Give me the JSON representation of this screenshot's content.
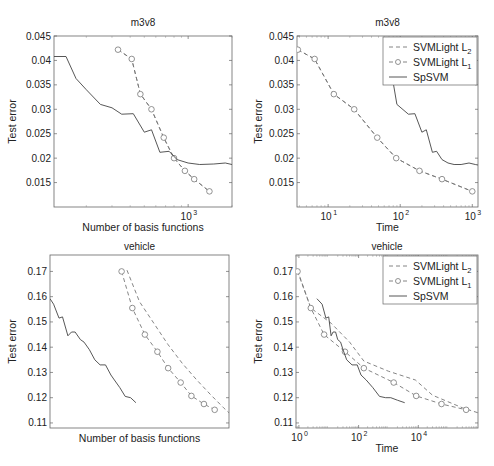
{
  "chart_data": [
    {
      "id": "m3v8-basis",
      "type": "line",
      "title": "m3v8",
      "xlabel": "Number of basis functions",
      "ylabel": "Test error",
      "xscale": "log",
      "xlim": [
        120,
        2000
      ],
      "ylim": [
        0.01,
        0.045
      ],
      "yticks": [
        "0.045",
        "0.04",
        "0.035",
        "0.03",
        "0.025",
        "0.02",
        "0.015"
      ],
      "xticks": [
        {
          "value": 1000,
          "label": "10",
          "exp": "3"
        }
      ],
      "grid": false,
      "legend": null,
      "series": [
        {
          "name": "SVMLight L2",
          "style": "dashed",
          "x": [
            330,
            410,
            470,
            560,
            680,
            800,
            950,
            1100,
            1400
          ],
          "y": [
            0.0422,
            0.0403,
            0.0331,
            0.03,
            0.0242,
            0.02,
            0.0174,
            0.0157,
            0.0132
          ]
        },
        {
          "name": "SVMLight L1",
          "style": "dashed-circle",
          "x": [
            330,
            410,
            470,
            560,
            680,
            800,
            950,
            1100,
            1400
          ],
          "y": [
            0.0422,
            0.0403,
            0.0331,
            0.03,
            0.0242,
            0.02,
            0.0174,
            0.0157,
            0.0132
          ]
        },
        {
          "name": "SpSVM",
          "style": "solid",
          "x": [
            120,
            145,
            170,
            200,
            250,
            300,
            350,
            420,
            500,
            560,
            640,
            740,
            840,
            1000,
            1200,
            1500,
            1800,
            2000
          ],
          "y": [
            0.0408,
            0.0408,
            0.0363,
            0.034,
            0.031,
            0.0303,
            0.029,
            0.0291,
            0.0253,
            0.0258,
            0.0212,
            0.0214,
            0.0197,
            0.019,
            0.0187,
            0.0188,
            0.019,
            0.0187
          ]
        }
      ]
    },
    {
      "id": "m3v8-time",
      "type": "line",
      "title": "m3v8",
      "xlabel": "Time",
      "ylabel": "Test error",
      "xscale": "log",
      "xlim": [
        3.7,
        1200
      ],
      "ylim": [
        0.01,
        0.045
      ],
      "yticks": [
        "0.045",
        "0.04",
        "0.035",
        "0.03",
        "0.025",
        "0.02",
        "0.015"
      ],
      "xticks": [
        {
          "value": 10,
          "label": "10",
          "exp": "1"
        },
        {
          "value": 100,
          "label": "10",
          "exp": "2"
        },
        {
          "value": 1000,
          "label": "10",
          "exp": "3"
        }
      ],
      "grid": false,
      "legend": {
        "position": "upper right",
        "entries": [
          {
            "label": "SVMLight L",
            "sub": "2",
            "style": "dashed"
          },
          {
            "label": "SVMLight L",
            "sub": "1",
            "style": "dashed-circle"
          },
          {
            "label": "SpSVM",
            "style": "solid"
          }
        ]
      },
      "series": [
        {
          "name": "SVMLight L2",
          "style": "dashed",
          "x": [
            3.8,
            6.5,
            12,
            23,
            48,
            88,
            185,
            380,
            1000
          ],
          "y": [
            0.0422,
            0.0403,
            0.0331,
            0.03,
            0.0242,
            0.02,
            0.0174,
            0.0157,
            0.0132
          ]
        },
        {
          "name": "SVMLight L1",
          "style": "dashed-circle",
          "x": [
            3.8,
            6.5,
            12,
            23,
            48,
            88,
            185,
            380,
            1000
          ],
          "y": [
            0.0422,
            0.0403,
            0.0331,
            0.03,
            0.0242,
            0.02,
            0.0174,
            0.0157,
            0.0132
          ]
        },
        {
          "name": "SpSVM",
          "style": "solid",
          "x": [
            65,
            70,
            90,
            130,
            160,
            200,
            230,
            280,
            320,
            380,
            460,
            560,
            700,
            900,
            1100,
            1200
          ],
          "y": [
            0.0408,
            0.0405,
            0.031,
            0.029,
            0.0291,
            0.0253,
            0.0258,
            0.0212,
            0.0214,
            0.0197,
            0.019,
            0.0187,
            0.0187,
            0.019,
            0.0187,
            0.0186
          ]
        }
      ]
    },
    {
      "id": "vehicle-basis",
      "type": "line",
      "title": "vehicle",
      "xlabel": "Number of basis functions",
      "ylabel": "Test error",
      "xscale": "linear",
      "xlim": [
        0,
        1
      ],
      "ylim": [
        0.108,
        0.1765
      ],
      "yticks": [
        "0.17",
        "0.16",
        "0.15",
        "0.14",
        "0.13",
        "0.12",
        "0.11"
      ],
      "xticks": [],
      "grid": false,
      "legend": null,
      "series": [
        {
          "name": "SVMLight L2",
          "style": "dashed",
          "x": [
            0.43,
            0.5,
            0.58,
            0.66,
            0.74,
            0.82,
            0.9,
            0.97,
            1.0
          ],
          "y": [
            0.1705,
            0.158,
            0.1495,
            0.141,
            0.1335,
            0.127,
            0.121,
            0.116,
            0.114
          ]
        },
        {
          "name": "SVMLight L1",
          "style": "dashed-circle",
          "x": [
            0.4,
            0.46,
            0.53,
            0.6,
            0.66,
            0.73,
            0.79,
            0.86,
            0.92
          ],
          "y": [
            0.17,
            0.1555,
            0.145,
            0.1382,
            0.1317,
            0.126,
            0.1207,
            0.1175,
            0.1152
          ]
        },
        {
          "name": "SpSVM",
          "style": "solid",
          "x": [
            0.0,
            0.02,
            0.05,
            0.07,
            0.1,
            0.12,
            0.14,
            0.17,
            0.19,
            0.22,
            0.25,
            0.28,
            0.31,
            0.34,
            0.36,
            0.39,
            0.42,
            0.45,
            0.48
          ],
          "y": [
            0.1592,
            0.157,
            0.1515,
            0.152,
            0.1445,
            0.146,
            0.146,
            0.143,
            0.142,
            0.139,
            0.135,
            0.133,
            0.133,
            0.129,
            0.127,
            0.124,
            0.1205,
            0.12,
            0.118
          ]
        }
      ]
    },
    {
      "id": "vehicle-time",
      "type": "line",
      "title": "vehicle",
      "xlabel": "Time",
      "ylabel": "Test error",
      "xscale": "log",
      "xlim": [
        0.8,
        1000000
      ],
      "ylim": [
        0.108,
        0.1765
      ],
      "yticks": [
        "0.17",
        "0.16",
        "0.15",
        "0.14",
        "0.13",
        "0.12",
        "0.11"
      ],
      "xticks": [
        {
          "value": 1,
          "label": "10",
          "exp": "0"
        },
        {
          "value": 100,
          "label": "10",
          "exp": "2"
        },
        {
          "value": 10000,
          "label": "10",
          "exp": "4"
        }
      ],
      "grid": false,
      "legend": {
        "position": "upper right",
        "entries": [
          {
            "label": "SVMLight L",
            "sub": "2",
            "style": "dashed"
          },
          {
            "label": "SVMLight L",
            "sub": "1",
            "style": "dashed-circle"
          },
          {
            "label": "SpSVM",
            "style": "solid"
          }
        ]
      },
      "series": [
        {
          "name": "SVMLight L2",
          "style": "dashed",
          "x": [
            0.9,
            2.5,
            12,
            50,
            150,
            1000,
            8000,
            30000,
            300000,
            1000000
          ],
          "y": [
            0.1705,
            0.1555,
            0.1495,
            0.142,
            0.1345,
            0.1305,
            0.127,
            0.121,
            0.116,
            0.114
          ]
        },
        {
          "name": "SVMLight L1",
          "style": "dashed-circle",
          "x": [
            0.9,
            2.5,
            7,
            35,
            150,
            1500,
            8500,
            60000,
            400000
          ],
          "y": [
            0.17,
            0.1555,
            0.145,
            0.1382,
            0.1317,
            0.126,
            0.1207,
            0.1175,
            0.1152
          ]
        },
        {
          "name": "SpSVM",
          "style": "solid",
          "x": [
            4,
            6,
            8,
            10,
            12,
            14,
            17,
            20,
            25,
            30,
            40,
            60,
            90,
            120,
            180,
            300,
            500,
            800,
            1200,
            2000,
            3500
          ],
          "y": [
            0.1592,
            0.157,
            0.1515,
            0.152,
            0.1445,
            0.146,
            0.146,
            0.143,
            0.142,
            0.139,
            0.135,
            0.133,
            0.133,
            0.129,
            0.127,
            0.124,
            0.1205,
            0.12,
            0.12,
            0.119,
            0.118
          ]
        }
      ]
    }
  ]
}
